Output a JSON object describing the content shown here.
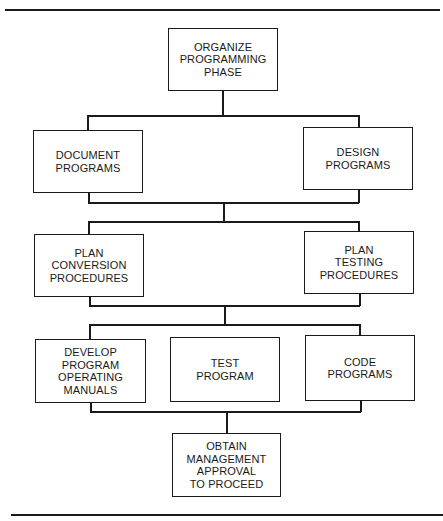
{
  "diagram": {
    "type": "flowchart",
    "nodes": {
      "organize": "ORGANIZE\nPROGRAMMING\nPHASE",
      "document": "DOCUMENT\nPROGRAMS",
      "design": "DESIGN\nPROGRAMS",
      "plan_conversion": "PLAN\nCONVERSION\nPROCEDURES",
      "plan_testing": "PLAN\nTESTING\nPROCEDURES",
      "develop_manuals": "DEVELOP\nPROGRAM\nOPERATING\nMANUALS",
      "test_program": "TEST\nPROGRAM",
      "code_programs": "CODE\nPROGRAMS",
      "obtain_approval": "OBTAIN\nMANAGEMENT\nAPPROVAL\nTO PROCEED"
    },
    "edges": [
      [
        "organize",
        "document"
      ],
      [
        "organize",
        "design"
      ],
      [
        "document",
        "plan_conversion"
      ],
      [
        "design",
        "plan_testing"
      ],
      [
        "plan_conversion",
        "develop_manuals"
      ],
      [
        "plan_conversion",
        "test_program"
      ],
      [
        "plan_testing",
        "code_programs"
      ],
      [
        "develop_manuals",
        "obtain_approval"
      ],
      [
        "test_program",
        "obtain_approval"
      ],
      [
        "code_programs",
        "obtain_approval"
      ]
    ]
  }
}
